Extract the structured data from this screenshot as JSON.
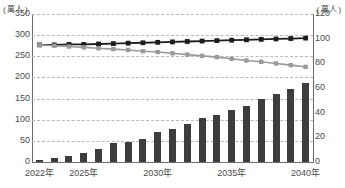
{
  "axes": {
    "left_unit": "( 萬人 )",
    "right_unit": "( 萬人 )",
    "left_ticks": [
      "350",
      "300",
      "250",
      "200",
      "150",
      "100",
      "50",
      "0"
    ],
    "right_ticks": [
      "120",
      "100",
      "80",
      "60",
      "40",
      "20",
      "0"
    ],
    "x_ticks": [
      {
        "label": "2022年",
        "year": 2022
      },
      {
        "label": "2025年",
        "year": 2025
      },
      {
        "label": "2030年",
        "year": 2030
      },
      {
        "label": "2035年",
        "year": 2035
      },
      {
        "label": "2040年",
        "year": 2040
      }
    ]
  },
  "colors": {
    "bar": "#3d3d3d",
    "line_dark": "#1c1c1c",
    "line_gray": "#9a9a9a",
    "grid": "#b9b9b9",
    "axis": "#6d6d6d",
    "text": "#4a4a4a"
  },
  "chart_data": {
    "type": "bar",
    "title": "",
    "xlabel": "",
    "ylabel": "( 萬人 )",
    "y2label": "( 萬人 )",
    "ylim": [
      0,
      350
    ],
    "y2lim": [
      0,
      120
    ],
    "grid": true,
    "legend": "none",
    "categories": [
      "2022年",
      "2023年",
      "2024年",
      "2025年",
      "2026年",
      "2027年",
      "2028年",
      "2029年",
      "2030年",
      "2031年",
      "2032年",
      "2033年",
      "2034年",
      "2035年",
      "2036年",
      "2037年",
      "2038年",
      "2039年",
      "2040年"
    ],
    "series": [
      {
        "name": "bar-series",
        "type": "bar",
        "axis": "left",
        "values": [
          4,
          9,
          14,
          22,
          30,
          45,
          48,
          55,
          70,
          78,
          90,
          103,
          112,
          124,
          133,
          148,
          160,
          172,
          186
        ]
      },
      {
        "name": "line-dark-series",
        "type": "line",
        "axis": "left",
        "marker": "square",
        "values": [
          277,
          277,
          278,
          278,
          279,
          280,
          281,
          282,
          283,
          284,
          285,
          286,
          287,
          288,
          289,
          290,
          291,
          292,
          293
        ]
      },
      {
        "name": "line-gray-series",
        "type": "line",
        "axis": "left",
        "marker": "square",
        "values": [
          277,
          275,
          273,
          271,
          269,
          267,
          265,
          262,
          260,
          257,
          254,
          251,
          248,
          244,
          240,
          237,
          233,
          229,
          225
        ]
      }
    ]
  }
}
